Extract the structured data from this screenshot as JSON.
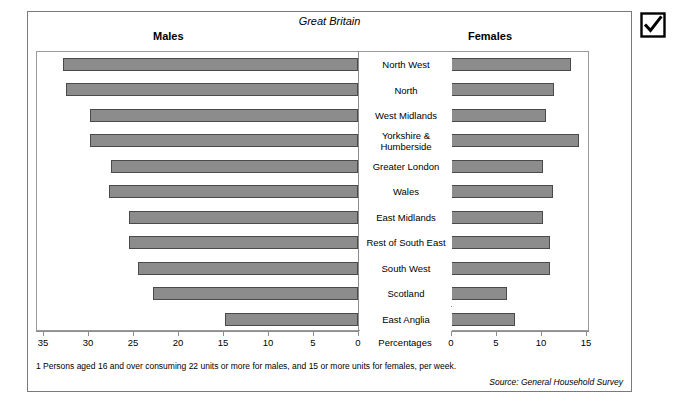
{
  "figure": {
    "country_label": "Great Britain",
    "males_header": "Males",
    "females_header": "Females",
    "percentages_label": "Percentages",
    "footnote": "1  Persons aged 16 and over consuming 22 units or more for males, and 15 or more units for females, per week.",
    "source": "Source: General Household Survey",
    "bar_fill": "#8c8c8c",
    "bar_stroke": "#4a4a4a",
    "frame_color": "#9a9a9a"
  },
  "icons": {
    "checkbox_checked": "checkbox-checked-icon"
  },
  "axes": {
    "left": {
      "ticks": [
        35,
        30,
        25,
        20,
        15,
        10,
        5,
        0
      ],
      "min": 0,
      "max": 35,
      "direction": "reversed"
    },
    "right": {
      "ticks": [
        0,
        5,
        10,
        15
      ],
      "min": 0,
      "max": 15,
      "direction": "normal"
    }
  },
  "chart_data": {
    "type": "bar",
    "subtype": "diverging-population-pyramid",
    "title": "Great Britain",
    "xlabel": "Percentages",
    "ylabel": "",
    "categories": [
      "North West",
      "North",
      "West Midlands",
      "Yorkshire & Humberside",
      "Greater London",
      "Wales",
      "East Midlands",
      "Rest of South East",
      "South West",
      "Scotland",
      "East Anglia"
    ],
    "series": [
      {
        "name": "Males",
        "side": "left",
        "xlim": [
          0,
          35
        ],
        "values": [
          32.8,
          32.5,
          29.8,
          29.8,
          27.5,
          27.7,
          25.5,
          25.5,
          24.5,
          22.8,
          14.8
        ]
      },
      {
        "name": "Females",
        "side": "right",
        "xlim": [
          0,
          15
        ],
        "values": [
          13.3,
          11.4,
          10.5,
          14.2,
          10.2,
          11.3,
          10.2,
          11.0,
          11.0,
          6.2,
          7.1
        ]
      }
    ],
    "grid": false,
    "legend": "headers-above-panels"
  }
}
